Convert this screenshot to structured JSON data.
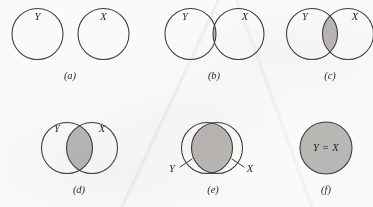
{
  "figure": {
    "type": "venn-diagram-series",
    "width": 373,
    "height": 207,
    "background_color": "#fbfaf8",
    "stroke_color": "#3b3a38",
    "shade_color": "#b9b7b4"
  },
  "labels": {
    "y": "Y",
    "x": "X",
    "equal": "Y = X"
  },
  "panels": [
    {
      "id": "a",
      "caption": "(a)",
      "caption_x": 70,
      "caption_y": 77,
      "relation": "disjoint",
      "shaded": false,
      "circles": [
        {
          "name": "y-circle",
          "cx": 37.5,
          "cy": 34,
          "r": 25.5,
          "label": "Y",
          "label_x": 37.5,
          "label_y": 18
        },
        {
          "name": "x-circle",
          "cx": 103.5,
          "cy": 34,
          "r": 25.5,
          "label": "X",
          "label_x": 103.5,
          "label_y": 18
        }
      ]
    },
    {
      "id": "b",
      "caption": "(b)",
      "caption_x": 214,
      "caption_y": 77,
      "relation": "slight-overlap",
      "shaded": true,
      "circles": [
        {
          "name": "y-circle",
          "cx": 190.5,
          "cy": 34,
          "r": 25.5,
          "label": "Y",
          "label_x": 185,
          "label_y": 18
        },
        {
          "name": "x-circle",
          "cx": 238.5,
          "cy": 34,
          "r": 25.5,
          "label": "X",
          "label_x": 245,
          "label_y": 18
        }
      ]
    },
    {
      "id": "c",
      "caption": "(c)",
      "caption_x": 330,
      "caption_y": 77,
      "relation": "moderate-overlap",
      "shaded": true,
      "circles": [
        {
          "name": "y-circle",
          "cx": 312,
          "cy": 34,
          "r": 25.5,
          "label": "Y",
          "label_x": 305,
          "label_y": 18
        },
        {
          "name": "x-circle",
          "cx": 348,
          "cy": 34,
          "r": 25.5,
          "label": "X",
          "label_x": 355,
          "label_y": 18
        }
      ]
    },
    {
      "id": "d",
      "caption": "(d)",
      "caption_x": 79,
      "caption_y": 191,
      "relation": "large-overlap",
      "shaded": true,
      "circles": [
        {
          "name": "y-circle",
          "cx": 67,
          "cy": 148,
          "r": 25.5,
          "label": "Y",
          "label_x": 57,
          "label_y": 130
        },
        {
          "name": "x-circle",
          "cx": 92,
          "cy": 148,
          "r": 25.5,
          "label": "X",
          "label_x": 102,
          "label_y": 130
        }
      ]
    },
    {
      "id": "e",
      "caption": "(e)",
      "caption_x": 213,
      "caption_y": 191,
      "relation": "near-identical",
      "shaded": true,
      "circles": [
        {
          "name": "y-circle",
          "cx": 207,
          "cy": 148,
          "r": 25.5,
          "label": "Y",
          "label_x": 172,
          "label_y": 170
        },
        {
          "name": "x-circle",
          "cx": 217,
          "cy": 148,
          "r": 25.5,
          "label": "X",
          "label_x": 250,
          "label_y": 170
        }
      ],
      "leaders": [
        {
          "name": "y-leader",
          "x1": 180,
          "y1": 167,
          "x2": 192,
          "y2": 159
        },
        {
          "name": "x-leader",
          "x1": 244,
          "y1": 167,
          "x2": 232,
          "y2": 159
        }
      ]
    },
    {
      "id": "f",
      "caption": "(f)",
      "caption_x": 326,
      "caption_y": 191,
      "relation": "identical",
      "shaded": true,
      "circles": [
        {
          "name": "yx-circle",
          "cx": 326,
          "cy": 148,
          "r": 26,
          "label": "Y = X",
          "label_x": 326,
          "label_y": 148
        }
      ]
    }
  ]
}
